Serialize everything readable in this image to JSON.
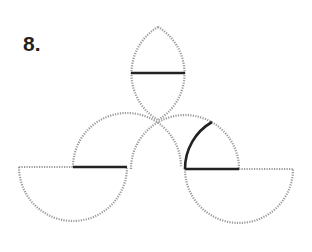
{
  "figure": {
    "label": "8.",
    "colors": {
      "dotted_stroke": "#9a9a9a",
      "solid_stroke": "#222222",
      "label": "#222222",
      "background": "#ffffff"
    },
    "radius_px": 54,
    "elements": {
      "lens": {
        "top": [
          158,
          27
        ],
        "bottom": [
          158,
          120
        ],
        "chord": {
          "from": [
            131,
            73
          ],
          "to": [
            185,
            73
          ],
          "style": "solid"
        }
      },
      "left_upper_arc": {
        "center": [
          127,
          167
        ],
        "from": [
          73,
          167
        ],
        "to": [
          181,
          167
        ],
        "style": "dotted"
      },
      "right_upper_arc": {
        "center": [
          185,
          169
        ],
        "from": [
          131,
          169
        ],
        "to": [
          239,
          169
        ],
        "style": "dotted"
      },
      "left_semicircle": {
        "center": [
          73,
          167
        ],
        "style": "dotted",
        "chord_dotted": {
          "from": [
            19,
            167
          ],
          "to": [
            73,
            167
          ]
        },
        "chord_solid": {
          "from": [
            73,
            167
          ],
          "to": [
            127,
            167
          ]
        }
      },
      "right_semicircle": {
        "center": [
          239,
          169
        ],
        "style": "dotted",
        "chord_solid": {
          "from": [
            185,
            169
          ],
          "to": [
            239,
            169
          ]
        },
        "chord_dotted": {
          "from": [
            239,
            169
          ],
          "to": [
            293,
            169
          ]
        }
      },
      "solid_arc": {
        "center": [
          239,
          169
        ],
        "from": [
          185,
          169
        ],
        "to": [
          212,
          122
        ],
        "style": "solid"
      }
    }
  }
}
